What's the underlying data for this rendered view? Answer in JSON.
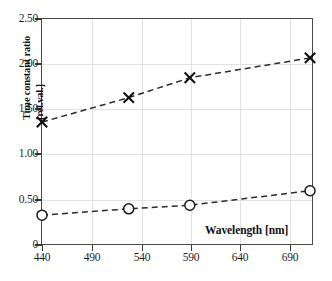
{
  "chart_data": {
    "type": "line",
    "title": "",
    "xlabel": "Wavelength [nm]",
    "ylabel": "Time constant ratio [rel.val.]",
    "ylabel_lines": [
      "Time constant",
      "ratio [rel.val.]"
    ],
    "xlim": [
      440,
      715
    ],
    "ylim": [
      0,
      2.5
    ],
    "xticks": [
      440,
      490,
      540,
      590,
      640,
      690
    ],
    "xticklabels": [
      "440",
      "490",
      "540",
      "590",
      "640",
      "690"
    ],
    "yticks": [
      0,
      0.5,
      1.0,
      1.5,
      2.0,
      2.5
    ],
    "yticklabels": [
      "0",
      "0.50",
      "1.00",
      "1.50",
      "2.00",
      "2.50"
    ],
    "grid": true,
    "legend": "none",
    "series": [
      {
        "name": "upper-series",
        "marker": "cross",
        "linestyle": "dashed",
        "x": [
          440,
          528,
          590,
          712
        ],
        "values": [
          1.36,
          1.63,
          1.85,
          2.07
        ]
      },
      {
        "name": "lower-series",
        "marker": "circle",
        "linestyle": "dashed",
        "x": [
          440,
          528,
          590,
          712
        ],
        "values": [
          0.33,
          0.4,
          0.44,
          0.6
        ]
      }
    ]
  },
  "colors": {
    "line": "#2b2b2b",
    "frame": "#4a4a4a",
    "grid": "#e2e2e2",
    "background": "#ffffff",
    "text": "#1a1a1a"
  }
}
